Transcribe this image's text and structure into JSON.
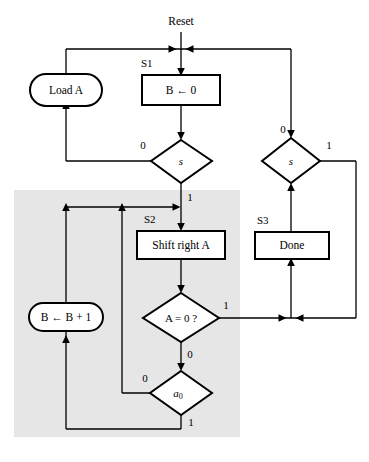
{
  "diagram": {
    "type": "asm-flowchart",
    "title_label": "Reset",
    "shade_color": "#e6e6e6",
    "line_color": "#000000",
    "background_color": "#ffffff",
    "states": [
      {
        "id": "S1",
        "label": "S1"
      },
      {
        "id": "S2",
        "label": "S2"
      },
      {
        "id": "S3",
        "label": "S3"
      }
    ],
    "nodes": [
      {
        "id": "load_a",
        "kind": "oval",
        "label": "Load A"
      },
      {
        "id": "b_clear",
        "kind": "box",
        "label": "B ← 0"
      },
      {
        "id": "s_left",
        "kind": "diamond",
        "label": "s"
      },
      {
        "id": "s_right",
        "kind": "diamond",
        "label": "s"
      },
      {
        "id": "shift_a",
        "kind": "box",
        "label": "Shift right A"
      },
      {
        "id": "done",
        "kind": "box",
        "label": "Done"
      },
      {
        "id": "a_is_zero",
        "kind": "diamond",
        "label": "A = 0 ?"
      },
      {
        "id": "a0",
        "kind": "diamond",
        "label_main": "a",
        "label_sub": "0"
      },
      {
        "id": "b_inc",
        "kind": "oval",
        "label": "B ← B + 1"
      }
    ],
    "edge_labels": {
      "s_left_zero": "0",
      "s_left_one": "1",
      "s_right_zero": "0",
      "s_right_one": "1",
      "a_is_zero_one": "1",
      "a_is_zero_zero": "0",
      "a0_zero": "0",
      "a0_one": "1"
    }
  }
}
